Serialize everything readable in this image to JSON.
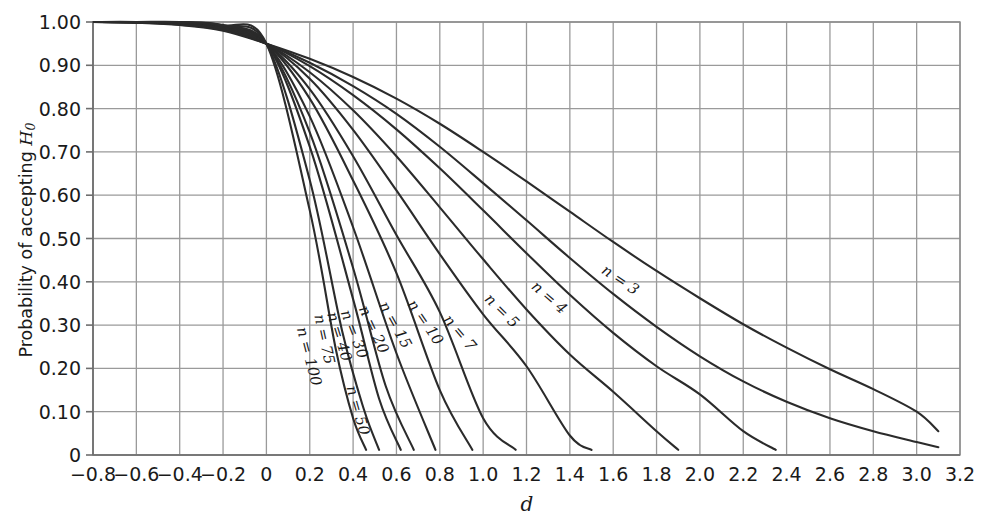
{
  "figure": {
    "background_color": "#ffffff",
    "curve_color": "#2b2b2b",
    "grid_color": "#b8b8b8",
    "axis_color": "#6e6e6e"
  },
  "axes": {
    "ylabel_prefix": "Probability of accepting ",
    "ylabel_symbol": "H",
    "ylabel_subscript": "0",
    "xlabel": "d",
    "y_ticks": [
      "1.00",
      "0.90",
      "0.80",
      "0.70",
      "0.60",
      "0.50",
      "0.40",
      "0.30",
      "0.20",
      "0.10",
      "0"
    ],
    "x_ticks": [
      "−0.8",
      "−0.6",
      "−0.4",
      "−0.2",
      "0",
      "0.2",
      "0.4",
      "0.6",
      "0.8",
      "1.0",
      "1.2",
      "1.4",
      "1.6",
      "1.8",
      "2.0",
      "2.2",
      "2.4",
      "2.6",
      "2.8",
      "3.0",
      "3.2"
    ]
  },
  "chart_data": {
    "type": "line",
    "title": "",
    "subtitle": "",
    "xlabel": "d",
    "ylabel": "Probability of accepting H0",
    "xlim": [
      -0.8,
      3.2
    ],
    "ylim": [
      0,
      1.0
    ],
    "xtick_values": [
      -0.8,
      -0.6,
      -0.4,
      -0.2,
      0,
      0.2,
      0.4,
      0.6,
      0.8,
      1.0,
      1.2,
      1.4,
      1.6,
      1.8,
      2.0,
      2.2,
      2.4,
      2.6,
      2.8,
      3.0,
      3.2
    ],
    "ytick_values": [
      1.0,
      0.9,
      0.8,
      0.7,
      0.6,
      0.5,
      0.4,
      0.3,
      0.2,
      0.1,
      0
    ],
    "grid": true,
    "legend": "inline-curve-labels",
    "convergence_point": {
      "d": 0.0,
      "p": 0.95
    },
    "series": [
      {
        "name": "n = 3",
        "label": "n = 3",
        "label_at": {
          "d": 1.62,
          "p": 0.395
        },
        "x": [
          -0.8,
          -0.6,
          -0.4,
          -0.2,
          0,
          0.2,
          0.4,
          0.6,
          0.8,
          1.0,
          1.2,
          1.4,
          1.6,
          1.8,
          2.0,
          2.2,
          2.4,
          2.6,
          2.8,
          3.0,
          3.1
        ],
        "y": [
          1.0,
          0.998,
          0.993,
          0.98,
          0.95,
          0.915,
          0.873,
          0.823,
          0.765,
          0.7,
          0.632,
          0.562,
          0.492,
          0.425,
          0.362,
          0.302,
          0.248,
          0.198,
          0.152,
          0.1,
          0.055
        ]
      },
      {
        "name": "n = 4",
        "label": "n = 4",
        "label_at": {
          "d": 1.29,
          "p": 0.355
        },
        "x": [
          -0.8,
          -0.6,
          -0.4,
          -0.2,
          0,
          0.2,
          0.4,
          0.6,
          0.8,
          1.0,
          1.2,
          1.4,
          1.6,
          1.8,
          2.0,
          2.2,
          2.4,
          2.6,
          2.8,
          3.0,
          3.1
        ],
        "y": [
          1.0,
          0.999,
          0.994,
          0.982,
          0.95,
          0.906,
          0.852,
          0.788,
          0.712,
          0.628,
          0.542,
          0.455,
          0.372,
          0.296,
          0.228,
          0.17,
          0.123,
          0.085,
          0.055,
          0.03,
          0.018
        ]
      },
      {
        "name": "n = 5",
        "label": "n = 5",
        "label_at": {
          "d": 1.07,
          "p": 0.325
        },
        "x": [
          -0.8,
          -0.6,
          -0.4,
          -0.2,
          0,
          0.2,
          0.4,
          0.6,
          0.8,
          1.0,
          1.2,
          1.4,
          1.6,
          1.8,
          2.0,
          2.2,
          2.35
        ],
        "y": [
          1.0,
          0.999,
          0.995,
          0.983,
          0.95,
          0.898,
          0.831,
          0.752,
          0.662,
          0.565,
          0.466,
          0.37,
          0.282,
          0.205,
          0.14,
          0.055,
          0.012
        ]
      },
      {
        "name": "n = 7",
        "label": "n = 7",
        "label_at": {
          "d": 0.875,
          "p": 0.275
        },
        "x": [
          -0.8,
          -0.6,
          -0.4,
          -0.2,
          0,
          0.2,
          0.4,
          0.6,
          0.8,
          1.0,
          1.2,
          1.4,
          1.6,
          1.8,
          1.9
        ],
        "y": [
          1.0,
          0.999,
          0.996,
          0.985,
          0.95,
          0.884,
          0.796,
          0.69,
          0.572,
          0.452,
          0.336,
          0.232,
          0.146,
          0.055,
          0.012
        ]
      },
      {
        "name": "n = 10",
        "label": "n = 10",
        "label_at": {
          "d": 0.715,
          "p": 0.3
        },
        "x": [
          -0.8,
          -0.6,
          -0.4,
          -0.2,
          0,
          0.2,
          0.4,
          0.6,
          0.8,
          1.0,
          1.2,
          1.4,
          1.5
        ],
        "y": [
          1.0,
          1.0,
          0.997,
          0.986,
          0.95,
          0.869,
          0.751,
          0.611,
          0.464,
          0.325,
          0.205,
          0.045,
          0.012
        ]
      },
      {
        "name": "n = 15",
        "label": "n = 15",
        "label_at": {
          "d": 0.575,
          "p": 0.295
        },
        "x": [
          -0.8,
          -0.6,
          -0.4,
          -0.2,
          0,
          0.2,
          0.4,
          0.6,
          0.8,
          1.0,
          1.15
        ],
        "y": [
          1.0,
          1.0,
          0.998,
          0.988,
          0.95,
          0.845,
          0.69,
          0.508,
          0.33,
          0.085,
          0.012
        ]
      },
      {
        "name": "n = 20",
        "label": "n = 20",
        "label_at": {
          "d": 0.475,
          "p": 0.285
        },
        "x": [
          -0.8,
          -0.6,
          -0.4,
          -0.2,
          0,
          0.2,
          0.4,
          0.6,
          0.8,
          0.95
        ],
        "y": [
          1.0,
          1.0,
          0.998,
          0.989,
          0.95,
          0.823,
          0.634,
          0.42,
          0.15,
          0.012
        ]
      },
      {
        "name": "n = 30",
        "label": "n = 30",
        "label_at": {
          "d": 0.385,
          "p": 0.275
        },
        "x": [
          -0.8,
          -0.6,
          -0.4,
          -0.2,
          0,
          0.2,
          0.4,
          0.6,
          0.78
        ],
        "y": [
          1.0,
          1.0,
          0.999,
          0.99,
          0.95,
          0.782,
          0.526,
          0.235,
          0.012
        ]
      },
      {
        "name": "n = 40",
        "label": "n = 40",
        "label_at": {
          "d": 0.315,
          "p": 0.27
        },
        "x": [
          -0.8,
          -0.6,
          -0.4,
          -0.2,
          0,
          0.2,
          0.4,
          0.55,
          0.68
        ],
        "y": [
          1.0,
          1.0,
          0.999,
          0.991,
          0.95,
          0.745,
          0.432,
          0.16,
          0.012
        ]
      },
      {
        "name": "n = 50",
        "label": "n = 50",
        "label_at": {
          "d": 0.4,
          "p": 0.1
        },
        "x": [
          -0.8,
          -0.6,
          -0.4,
          -0.2,
          0,
          0.2,
          0.4,
          0.52,
          0.62
        ],
        "y": [
          1.0,
          1.0,
          0.999,
          0.991,
          0.95,
          0.712,
          0.36,
          0.13,
          0.012
        ]
      },
      {
        "name": "n = 75",
        "label": "n = 75",
        "label_at": {
          "d": 0.245,
          "p": 0.265
        },
        "x": [
          -0.8,
          -0.6,
          -0.4,
          -0.2,
          0,
          0.2,
          0.35,
          0.45,
          0.52
        ],
        "y": [
          1.0,
          1.0,
          0.999,
          0.992,
          0.95,
          0.635,
          0.285,
          0.105,
          0.012
        ]
      },
      {
        "name": "n = 100",
        "label": "n = 100",
        "label_at": {
          "d": 0.175,
          "p": 0.225
        },
        "x": [
          -0.8,
          -0.6,
          -0.4,
          -0.2,
          0,
          0.2,
          0.32,
          0.4,
          0.46
        ],
        "y": [
          1.0,
          1.0,
          1.0,
          0.993,
          0.95,
          0.565,
          0.245,
          0.085,
          0.012
        ]
      }
    ]
  }
}
